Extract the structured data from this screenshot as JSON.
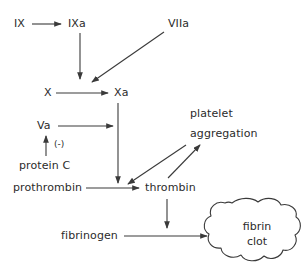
{
  "diagram": {
    "type": "flow-diagram",
    "background_color": "#ffffff",
    "stroke_color": "#3a3a3a",
    "text_color": "#2b2b2b"
  },
  "nodes": {
    "ix": "IX",
    "ixa": "IXa",
    "viia": "VIIa",
    "x": "X",
    "xa": "Xa",
    "va": "Va",
    "inhibition_sign": "(-)",
    "protein_c": "protein C",
    "prothrombin": "prothrombin",
    "thrombin": "thrombin",
    "platelet": "platelet",
    "aggregation": "aggregation",
    "fibrinogen": "fibrinogen",
    "fibrin": "fibrin",
    "clot": "clot"
  },
  "edges": [
    {
      "from": "IX",
      "to": "IXa",
      "kind": "activation"
    },
    {
      "from": "IXa",
      "to": "X",
      "kind": "activation"
    },
    {
      "from": "VIIa",
      "to": "X",
      "kind": "activation"
    },
    {
      "from": "X",
      "to": "Xa",
      "kind": "activation"
    },
    {
      "from": "Xa",
      "to": "prothrombin-to-thrombin",
      "kind": "activation"
    },
    {
      "from": "Va",
      "to": "prothrombin-to-thrombin",
      "kind": "activation"
    },
    {
      "from": "protein C",
      "to": "Va",
      "kind": "inhibition",
      "sign": "(-)"
    },
    {
      "from": "prothrombin",
      "to": "thrombin",
      "kind": "conversion"
    },
    {
      "from": "thrombin",
      "to": "prothrombin-to-thrombin",
      "kind": "feedback"
    },
    {
      "from": "thrombin",
      "to": "platelet aggregation",
      "kind": "activation"
    },
    {
      "from": "thrombin",
      "to": "fibrinogen-to-fibrin",
      "kind": "activation"
    },
    {
      "from": "fibrinogen",
      "to": "fibrin clot",
      "kind": "conversion"
    }
  ]
}
